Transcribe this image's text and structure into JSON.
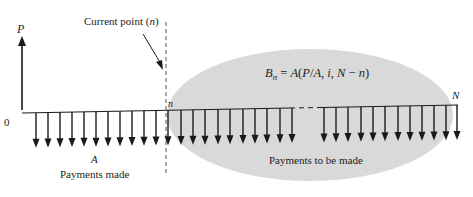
{
  "diagram": {
    "axis_label_y": "P",
    "origin_label": "0",
    "current_point_label": "Current point (n)",
    "n_label": "n",
    "N_label": "N",
    "formula": "Bₙ = A(P/A, i, N − n)",
    "formula_parts": {
      "B": "B",
      "sub": "n",
      "rest": " = A(P/A, i, N − n)"
    },
    "payment_symbol": "A",
    "payments_made_label": "Payments made",
    "payments_to_be_made_label": "Payments to be made",
    "arrows_made_x": [
      36,
      48,
      60,
      72,
      84,
      96,
      108,
      120,
      132,
      144,
      156,
      168
    ],
    "arrows_future_x": [
      181,
      193,
      205,
      218,
      230,
      243,
      255,
      267,
      280,
      292,
      304,
      316,
      329
    ],
    "arrows_final_x": [
      324,
      336,
      348,
      361,
      373,
      385,
      398,
      410,
      422,
      434,
      446,
      457
    ],
    "colors": {
      "ellipse_fill": "#d9d9d9",
      "line": "#1a1a1a",
      "dashed": "#555555"
    }
  }
}
